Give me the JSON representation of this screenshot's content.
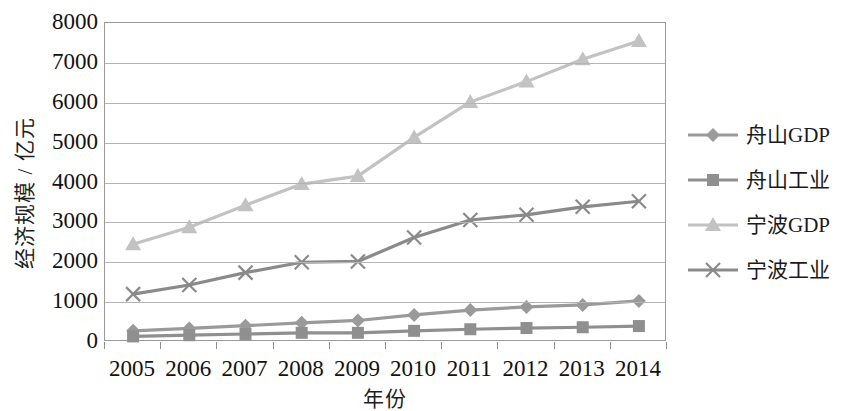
{
  "chart_data": {
    "type": "line",
    "title": "",
    "xlabel": "年份",
    "ylabel": "经济规模 / 亿元",
    "categories": [
      "2005",
      "2006",
      "2007",
      "2008",
      "2009",
      "2010",
      "2011",
      "2012",
      "2013",
      "2014"
    ],
    "ylim": [
      0,
      8000
    ],
    "ytick_labels": [
      "0",
      "1000",
      "2000",
      "3000",
      "4000",
      "5000",
      "6000",
      "7000",
      "8000"
    ],
    "ytick_values": [
      0,
      1000,
      2000,
      3000,
      4000,
      5000,
      6000,
      7000,
      8000
    ],
    "grid": "horizontal",
    "legend_position": "right",
    "series": [
      {
        "name": "舟山GDP",
        "marker": "diamond",
        "color": "#9a9a9a",
        "values": [
          280,
          340,
          410,
          480,
          540,
          680,
          800,
          880,
          930,
          1030
        ]
      },
      {
        "name": "舟山工业",
        "marker": "square",
        "color": "#8f8f8f",
        "values": [
          140,
          170,
          200,
          230,
          230,
          280,
          320,
          350,
          370,
          400
        ]
      },
      {
        "name": "宁波GDP",
        "marker": "triangle",
        "color": "#c2c2c2",
        "values": [
          2450,
          2880,
          3430,
          3960,
          4160,
          5130,
          6020,
          6530,
          7090,
          7550
        ]
      },
      {
        "name": "宁波工业",
        "marker": "x",
        "color": "#8a8a8a",
        "values": [
          1200,
          1430,
          1740,
          2000,
          2020,
          2620,
          3060,
          3190,
          3390,
          3530
        ]
      }
    ]
  }
}
